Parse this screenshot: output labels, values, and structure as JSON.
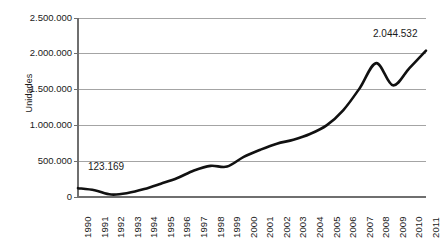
{
  "chart_data": {
    "type": "line",
    "title": "",
    "xlabel": "",
    "ylabel": "Unidades",
    "ylim": [
      0,
      2500000
    ],
    "grid": true,
    "legend": "none",
    "y_ticks": [
      "0",
      "500.000",
      "1.000.000",
      "1.500.000",
      "2.000.000",
      "2.500.000"
    ],
    "y_tick_values": [
      0,
      500000,
      1000000,
      1500000,
      2000000,
      2500000
    ],
    "categories": [
      "1990",
      "1991",
      "1992",
      "1993",
      "1994",
      "1995",
      "1996",
      "1997",
      "1998",
      "1999",
      "2000",
      "2001",
      "2002",
      "2003",
      "2004",
      "2005",
      "2006",
      "2007",
      "2008",
      "2009",
      "2010",
      "2011"
    ],
    "values": [
      123169,
      95000,
      35000,
      55000,
      110000,
      185000,
      265000,
      370000,
      435000,
      425000,
      560000,
      660000,
      745000,
      800000,
      880000,
      1000000,
      1210000,
      1520000,
      1870000,
      1560000,
      1800000,
      2044532
    ],
    "annotations": [
      {
        "label": "123.169",
        "category": "1990",
        "value": 123169
      },
      {
        "label": "2.044.532",
        "category": "2011",
        "value": 2044532
      }
    ],
    "series_color": "#111111",
    "grid_color": "#9a9a9a",
    "axis_color": "#6f6f6f",
    "background": "#ffffff"
  }
}
